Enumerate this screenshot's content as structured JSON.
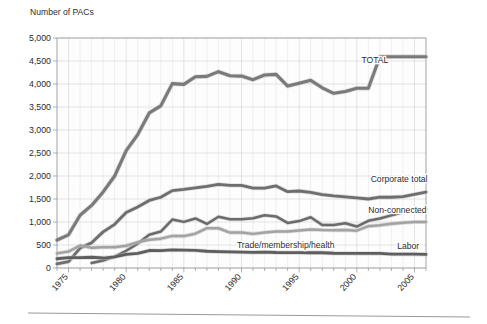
{
  "chart_data": {
    "type": "line",
    "title": "Number of PACs",
    "xlabel": "",
    "ylabel": "Number of PACs",
    "xlim": [
      1974,
      2006
    ],
    "ylim": [
      0,
      5000
    ],
    "grid": true,
    "legend_position": "inline-right-labels",
    "y_ticks": [
      "0",
      "500",
      "1,000",
      "1,500",
      "2,000",
      "2,500",
      "3,000",
      "3,500",
      "4,000",
      "4,500",
      "5,000"
    ],
    "y_tick_values": [
      0,
      500,
      1000,
      1500,
      2000,
      2500,
      3000,
      3500,
      4000,
      4500,
      5000
    ],
    "x_ticks": [
      "1975",
      "1980",
      "1985",
      "1990",
      "1995",
      "2000",
      "2005"
    ],
    "x_tick_values": [
      1975,
      1980,
      1985,
      1990,
      1995,
      2000,
      2005
    ],
    "x": [
      1974,
      1975,
      1976,
      1977,
      1978,
      1979,
      1980,
      1981,
      1982,
      1983,
      1984,
      1985,
      1986,
      1987,
      1988,
      1989,
      1990,
      1991,
      1992,
      1993,
      1994,
      1995,
      1996,
      1997,
      1998,
      1999,
      2000,
      2001,
      2002,
      2003,
      2004,
      2005,
      2006
    ],
    "series": [
      {
        "name": "TOTAL",
        "label": "TOTAL",
        "color": "#7a7a7a",
        "width": 3.1,
        "label_x": 2000.4,
        "label_y": 4460,
        "values": [
          608,
          722,
          1146,
          1360,
          1653,
          2000,
          2551,
          2901,
          3371,
          3525,
          4009,
          3992,
          4157,
          4165,
          4268,
          4178,
          4172,
          4094,
          4195,
          4210,
          3954,
          4016,
          4079,
          3917,
          3798,
          3835,
          3907,
          3907,
          4594,
          4594,
          4594,
          4594,
          4594
        ]
      },
      {
        "name": "Corporate total",
        "label": "Corporate total",
        "color": "#6e6e6e",
        "width": 2.8,
        "label_x": 2001.2,
        "label_y": 1880,
        "values": [
          89,
          139,
          433,
          550,
          785,
          950,
          1206,
          1327,
          1469,
          1538,
          1682,
          1710,
          1744,
          1775,
          1816,
          1796,
          1795,
          1738,
          1735,
          1785,
          1660,
          1674,
          1642,
          1597,
          1567,
          1548,
          1523,
          1500,
          1540,
          1538,
          1550,
          1600,
          1650
        ]
      },
      {
        "name": "Non-connected",
        "label": "Non-connected",
        "color": "#6b6b6b",
        "width": 2.5,
        "label_x": 2001.0,
        "label_y": 1185,
        "values": [
          0,
          0,
          0,
          110,
          162,
          247,
          374,
          531,
          723,
          793,
          1053,
          1003,
          1077,
          957,
          1115,
          1060,
          1062,
          1083,
          1145,
          1121,
          980,
          1020,
          1103,
          935,
          935,
          972,
          902,
          1026,
          1075,
          1145,
          1210,
          1250,
          1280
        ]
      },
      {
        "name": "Trade/membership/health",
        "label": "Trade/membership/health",
        "color": "#a3a3a3",
        "width": 2.5,
        "label_x": 1989.6,
        "label_y": 430,
        "values": [
          318,
          357,
          489,
          438,
          451,
          453,
          484,
          560,
          615,
          638,
          698,
          693,
          745,
          865,
          865,
          770,
          774,
          742,
          770,
          792,
          792,
          815,
          837,
          825,
          822,
          828,
          812,
          910,
          930,
          960,
          985,
          1000,
          1000
        ]
      },
      {
        "name": "Labor",
        "label": "Labor",
        "color": "#5e5e5e",
        "width": 2.8,
        "label_x": 2003.5,
        "label_y": 410,
        "values": [
          201,
          226,
          224,
          234,
          217,
          240,
          297,
          318,
          380,
          378,
          394,
          388,
          384,
          364,
          354,
          349,
          346,
          338,
          347,
          337,
          333,
          334,
          332,
          332,
          321,
          318,
          316,
          316,
          317,
          302,
          302,
          300,
          296
        ]
      }
    ]
  },
  "figure": {
    "title": "Number of PACs"
  }
}
